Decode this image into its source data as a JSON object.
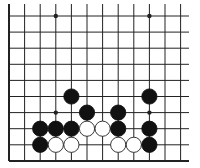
{
  "diagram": {
    "type": "go-board-fragment",
    "colors": {
      "background": "#ffffff",
      "line": "#222222",
      "black_stone": "#111111",
      "white_stone": "#ffffff",
      "white_stroke": "#222222"
    },
    "grid": {
      "origin_x": 9,
      "origin_y": 16,
      "spacing_x": 15.6,
      "spacing_y": 16.1,
      "columns": 12,
      "rows": 10,
      "line_top_extent": 4,
      "line_right_extent": 189,
      "left_edge_is_board_edge": true,
      "bottom_edge_is_board_edge": true
    },
    "star_points": [
      {
        "col": 3,
        "row": 0
      },
      {
        "col": 9,
        "row": 0
      },
      {
        "col": 3,
        "row": 6
      },
      {
        "col": 9,
        "row": 6
      }
    ],
    "stones": [
      {
        "color": "black",
        "col": 4,
        "row": 5
      },
      {
        "color": "black",
        "col": 9,
        "row": 5
      },
      {
        "color": "black",
        "col": 5,
        "row": 6
      },
      {
        "color": "black",
        "col": 7,
        "row": 6
      },
      {
        "color": "black",
        "col": 2,
        "row": 7
      },
      {
        "color": "black",
        "col": 3,
        "row": 7
      },
      {
        "color": "black",
        "col": 4,
        "row": 7
      },
      {
        "color": "white",
        "col": 5,
        "row": 7
      },
      {
        "color": "white",
        "col": 6,
        "row": 7
      },
      {
        "color": "black",
        "col": 7,
        "row": 7
      },
      {
        "color": "black",
        "col": 9,
        "row": 7
      },
      {
        "color": "black",
        "col": 2,
        "row": 8
      },
      {
        "color": "white",
        "col": 3,
        "row": 8
      },
      {
        "color": "white",
        "col": 4,
        "row": 8
      },
      {
        "color": "white",
        "col": 7,
        "row": 8
      },
      {
        "color": "white",
        "col": 8,
        "row": 8
      },
      {
        "color": "black",
        "col": 9,
        "row": 8
      }
    ],
    "stone_radius": 7.6
  }
}
